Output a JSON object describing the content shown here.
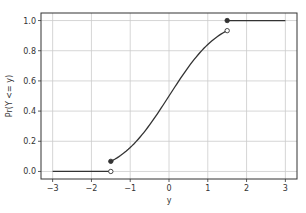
{
  "chart_data": {
    "type": "line",
    "title": "",
    "xlabel": "y",
    "ylabel": "Pr(Y <= y)",
    "xlim": [
      -3.3,
      3.3
    ],
    "ylim": [
      -0.05,
      1.05
    ],
    "grid": true,
    "x_ticks": [
      -3,
      -2,
      -1,
      0,
      1,
      2,
      3
    ],
    "x_tick_labels": [
      "−3",
      "−2",
      "−1",
      "0",
      "1",
      "2",
      "3"
    ],
    "y_ticks": [
      0.0,
      0.2,
      0.4,
      0.6,
      0.8,
      1.0
    ],
    "y_tick_labels": [
      "0.0",
      "0.2",
      "0.4",
      "0.6",
      "0.8",
      "1.0"
    ],
    "series": [
      {
        "name": "lower-flat",
        "x": [
          -3.0,
          -1.5
        ],
        "y": [
          0.0,
          0.0
        ]
      },
      {
        "name": "middle-cdf",
        "x": [
          -1.5,
          -1.0,
          -0.5,
          0.0,
          0.5,
          1.0,
          1.5
        ],
        "y": [
          0.067,
          0.159,
          0.309,
          0.5,
          0.691,
          0.841,
          0.933
        ]
      },
      {
        "name": "upper-flat",
        "x": [
          1.5,
          3.0
        ],
        "y": [
          1.0,
          1.0
        ]
      }
    ],
    "markers": [
      {
        "x": -1.5,
        "y": 0.0,
        "style": "open"
      },
      {
        "x": -1.5,
        "y": 0.067,
        "style": "filled"
      },
      {
        "x": 1.5,
        "y": 0.933,
        "style": "open"
      },
      {
        "x": 1.5,
        "y": 1.0,
        "style": "filled"
      }
    ],
    "colors": {
      "line": "#333333",
      "grid": "#cccccc",
      "frame": "#333333"
    }
  }
}
